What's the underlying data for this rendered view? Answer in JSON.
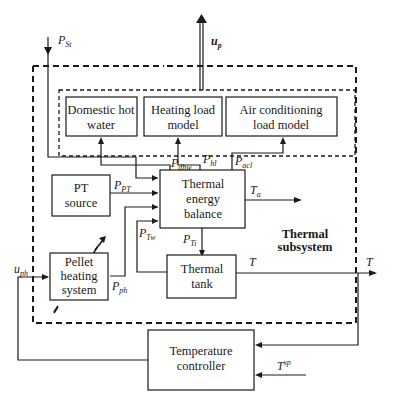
{
  "diagram": {
    "type": "block-diagram",
    "subsystem_label": [
      "Thermal",
      "subsystem"
    ],
    "blocks": {
      "domestic_hot_water": [
        "Domestic hot",
        "water"
      ],
      "heating_load_model": [
        "Heating load",
        "model"
      ],
      "air_conditioning_load_model": [
        "Air conditioning",
        "load model"
      ],
      "pt_source": [
        "PT",
        "source"
      ],
      "thermal_energy_balance": [
        "Thermal",
        "energy",
        "balance"
      ],
      "pellet_heating_system": [
        "Pellet",
        "heating",
        "system"
      ],
      "thermal_tank": [
        "Thermal",
        "tank"
      ],
      "temperature_controller": [
        "Temperature",
        "controller"
      ]
    },
    "signals": {
      "p_st": {
        "main": "P",
        "sub": "St"
      },
      "u_p": {
        "main": "u",
        "sub": "p"
      },
      "p_dhw": {
        "main": "P",
        "sub": "dhw"
      },
      "p_hl": {
        "main": "P",
        "sub": "hl"
      },
      "p_acl": {
        "main": "P",
        "sub": "acl"
      },
      "p_pt": {
        "main": "P",
        "sub": "PT"
      },
      "t_a": {
        "main": "T",
        "sub": "a"
      },
      "p_tw": {
        "main": "P",
        "sub": "Tw"
      },
      "p_ti": {
        "main": "P",
        "sub": "Ti"
      },
      "p_ph": {
        "main": "P",
        "sub": "ph"
      },
      "u_ph": {
        "main": "u",
        "sub": "ph"
      },
      "t_tank": {
        "main": "T"
      },
      "t_out": {
        "main": "T"
      },
      "t_sp": {
        "main": "T",
        "sup": "sp"
      }
    },
    "colors": {
      "line": "#1a1a1a",
      "background": "#ffffff"
    }
  }
}
